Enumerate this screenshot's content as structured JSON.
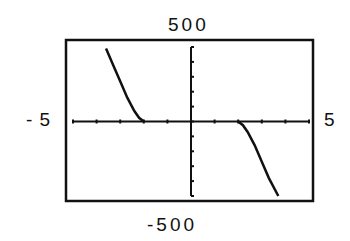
{
  "chart_data": {
    "type": "line",
    "title": "",
    "xlabel": "",
    "ylabel": "",
    "xlim": [
      -5,
      5
    ],
    "ylim": [
      -500,
      500
    ],
    "x_tick_spacing": 1,
    "y_tick_spacing": 100,
    "grid": false,
    "window_labels": {
      "ymax": "500",
      "ymin": "-500",
      "xmin": "- 5",
      "xmax": "5"
    },
    "series": [
      {
        "name": "curve",
        "x": [
          -3.6,
          -3.3,
          -3.0,
          -2.7,
          -2.4,
          -2.2,
          -2.0,
          2.0,
          2.2,
          2.4,
          2.7,
          3.0,
          3.3,
          3.7
        ],
        "y": [
          490,
          380,
          270,
          160,
          70,
          25,
          0,
          0,
          -25,
          -70,
          -160,
          -270,
          -380,
          -500
        ]
      }
    ]
  },
  "labels": {
    "top": "500",
    "bottom": "-500",
    "left": "- 5",
    "right": "5"
  }
}
